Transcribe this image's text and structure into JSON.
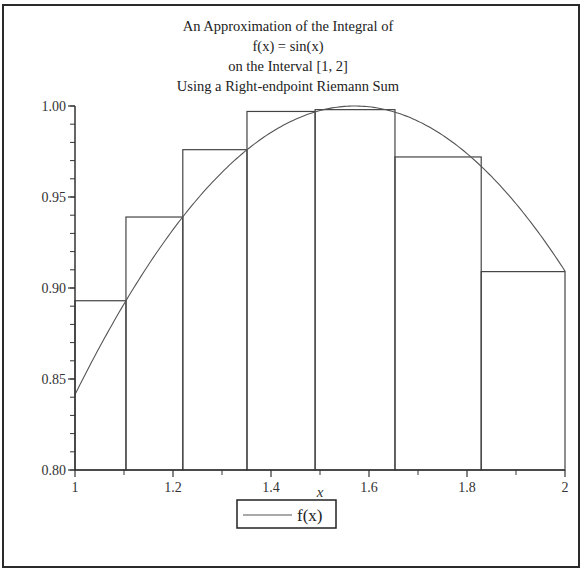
{
  "chart_data": {
    "type": "bar",
    "subtype": "riemann-sum-with-curve",
    "title_lines": [
      "An Approximation of the Integral of",
      "f(x) = sin(x)",
      "on the Interval [1, 2]",
      "Using a Right-endpoint Riemann Sum"
    ],
    "xlabel": "x",
    "ylabel": "",
    "xlim": [
      1,
      2
    ],
    "ylim": [
      0.8,
      1.0
    ],
    "x_ticks": [
      1,
      1.2,
      1.4,
      1.6,
      1.8,
      2
    ],
    "x_tick_labels": [
      "1",
      "1.2",
      "1.4",
      "1.6",
      "1.8",
      "2"
    ],
    "x_minor_ticks": [
      1.1,
      1.3,
      1.5,
      1.7,
      1.9
    ],
    "y_ticks": [
      0.8,
      0.85,
      0.9,
      0.95,
      1.0
    ],
    "y_tick_labels": [
      "0.80",
      "0.85",
      "0.90",
      "0.95",
      "1.00"
    ],
    "y_minor_step": 0.01,
    "partition": [
      1.0,
      1.104,
      1.22,
      1.351,
      1.49,
      1.653,
      1.829,
      2.0
    ],
    "rectangles": [
      {
        "x0": 1.0,
        "x1": 1.104,
        "height": 0.893
      },
      {
        "x0": 1.104,
        "x1": 1.22,
        "height": 0.939
      },
      {
        "x0": 1.22,
        "x1": 1.351,
        "height": 0.976
      },
      {
        "x0": 1.351,
        "x1": 1.49,
        "height": 0.997
      },
      {
        "x0": 1.49,
        "x1": 1.653,
        "height": 0.998
      },
      {
        "x0": 1.653,
        "x1": 1.829,
        "height": 0.972
      },
      {
        "x0": 1.829,
        "x1": 2.0,
        "height": 0.909
      }
    ],
    "series": [
      {
        "name": "f(x)",
        "function": "sin(x)",
        "domain": [
          1,
          2
        ]
      }
    ],
    "legend": {
      "entries": [
        "f(x)"
      ],
      "position": "bottom-center"
    },
    "grid": false
  },
  "colors": {
    "frame": "#2a2a2a",
    "axes": "#333333",
    "rect_stroke": "#444444",
    "curve": "#555555",
    "background": "#ffffff"
  }
}
